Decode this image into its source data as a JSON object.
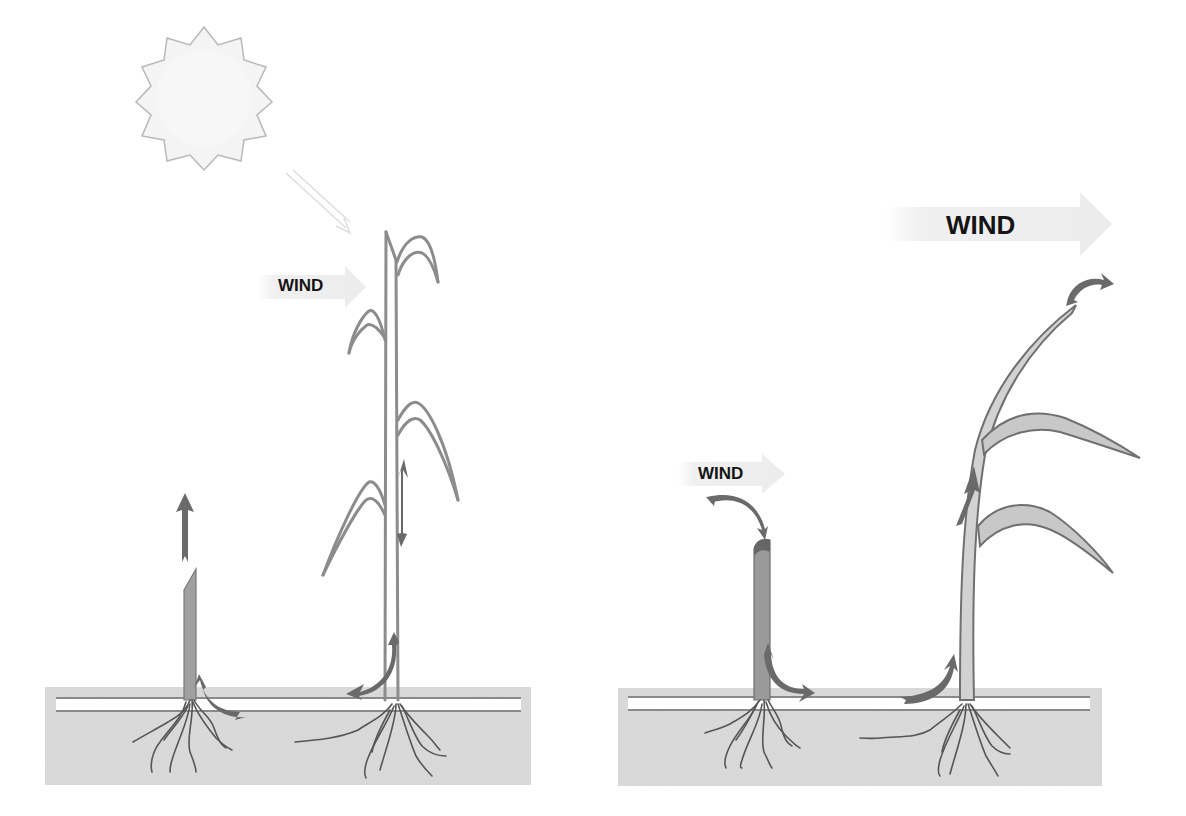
{
  "diagram": {
    "colors": {
      "background": "#ffffff",
      "soil": "#dcdcdc",
      "soil_surface_band": "#ffffff",
      "surface_line": "#8a8a8a",
      "stalk_outline": "#8c8c8c",
      "short_stalk_fill": "#9a9a9a",
      "tall_stalk_fill_right": "#d2d2d2",
      "arrow": "#6a6a6a",
      "roots": "#555555",
      "sun_fill": "#f4f4f4",
      "sun_outline": "#b5b5b5",
      "wind_arrow": "#efefef",
      "label_text": "#141414"
    },
    "left_panel": {
      "sun": {
        "label": "",
        "rays": 14
      },
      "light_arrow": {
        "direction": "down-right"
      },
      "wind_label": "WIND",
      "short_plant": {
        "arrows": [
          "up (from tip)",
          "curved down-right at base"
        ]
      },
      "tall_plant": {
        "leaves": 6,
        "arrows": [
          "down along stalk",
          "curved left at base"
        ]
      }
    },
    "right_panel": {
      "wind_label_small": "WIND",
      "wind_label_large": "WIND",
      "short_plant": {
        "arrows": [
          "curved onto tip",
          "curved right at base"
        ]
      },
      "tall_plant": {
        "leaves": 3,
        "arrows": [
          "curved off tip to right",
          "up along stalk",
          "curved up into base"
        ]
      }
    }
  }
}
